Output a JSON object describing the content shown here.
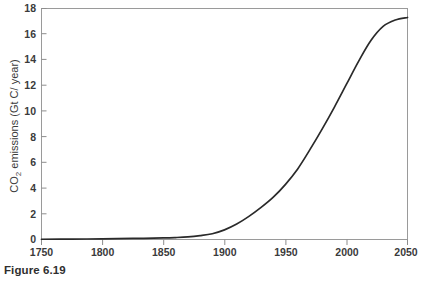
{
  "caption": "Figure 6.19",
  "axis": {
    "y_title_main": "CO",
    "y_title_sub": "2",
    "y_title_rest": " emissions (Gt C/ year)",
    "y_ticks": [
      "0",
      "2",
      "4",
      "6",
      "8",
      "10",
      "12",
      "14",
      "16",
      "18"
    ],
    "x_ticks": [
      "1750",
      "1800",
      "1850",
      "1900",
      "1950",
      "2000",
      "2050"
    ]
  },
  "colors": {
    "curve": "#2a2a2a",
    "frame": "#9a9a9a",
    "text": "#3b3b3b",
    "background": "#ffffff"
  },
  "chart_data": {
    "type": "line",
    "title": "",
    "xlabel": "",
    "ylabel": "CO2 emissions (Gt C/ year)",
    "xlim": [
      1750,
      2050
    ],
    "ylim": [
      0,
      18
    ],
    "grid": false,
    "legend": "none",
    "xticks": [
      1750,
      1800,
      1850,
      1900,
      1950,
      2000,
      2050
    ],
    "yticks": [
      0,
      2,
      4,
      6,
      8,
      10,
      12,
      14,
      16,
      18
    ],
    "series": [
      {
        "name": "CO2 emissions",
        "x": [
          1750,
          1775,
          1800,
          1825,
          1850,
          1860,
          1870,
          1880,
          1890,
          1900,
          1910,
          1920,
          1930,
          1940,
          1950,
          1960,
          1970,
          1980,
          1990,
          2000,
          2010,
          2020,
          2030,
          2040,
          2050
        ],
        "values": [
          0.02,
          0.03,
          0.05,
          0.08,
          0.12,
          0.15,
          0.2,
          0.3,
          0.45,
          0.75,
          1.2,
          1.8,
          2.5,
          3.3,
          4.3,
          5.5,
          7.0,
          8.6,
          10.3,
          12.1,
          13.9,
          15.5,
          16.6,
          17.1,
          17.3
        ]
      }
    ]
  }
}
